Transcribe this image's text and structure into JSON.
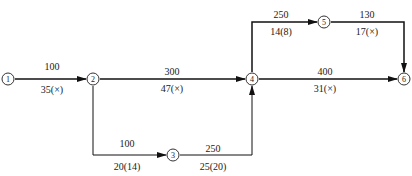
{
  "diagram": {
    "type": "network-diagram",
    "nodes": [
      {
        "id": "1",
        "label": "1",
        "x": 8,
        "y": 79
      },
      {
        "id": "2",
        "label": "2",
        "x": 93,
        "y": 79
      },
      {
        "id": "3",
        "label": "3",
        "x": 173,
        "y": 155
      },
      {
        "id": "4",
        "label": "4",
        "x": 252,
        "y": 79
      },
      {
        "id": "5",
        "label": "5",
        "x": 324,
        "y": 22
      },
      {
        "id": "6",
        "label": "6",
        "x": 404,
        "y": 79
      }
    ],
    "edges": [
      {
        "from": "1",
        "to": "2",
        "top": "100",
        "bottom": "35(×)"
      },
      {
        "from": "2",
        "to": "4",
        "top": "300",
        "bottom": "47(×)"
      },
      {
        "from": "2",
        "to": "3",
        "top": "100",
        "bottom": "20(14)"
      },
      {
        "from": "3",
        "to": "4",
        "top": "250",
        "bottom": "25(20)"
      },
      {
        "from": "4",
        "to": "5",
        "top": "250",
        "bottom": "14(8)"
      },
      {
        "from": "5",
        "to": "6",
        "top": "130",
        "bottom": "17(×)"
      },
      {
        "from": "4",
        "to": "6",
        "top": "400",
        "bottom": "31(×)"
      }
    ]
  }
}
